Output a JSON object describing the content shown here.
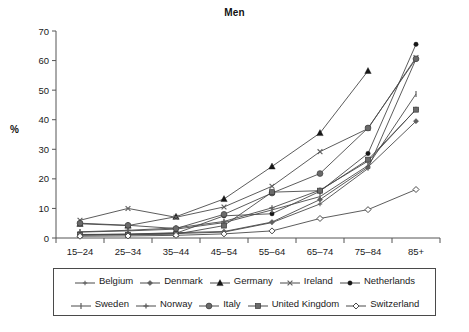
{
  "chart_data": {
    "type": "line",
    "title": "Men",
    "xlabel": "",
    "ylabel": "%",
    "categories": [
      "15–24",
      "25–34",
      "35–44",
      "45–54",
      "55–64",
      "65–74",
      "75–84",
      "85+"
    ],
    "ylim": [
      0,
      70
    ],
    "yticks": [
      0,
      10,
      20,
      30,
      40,
      50,
      60,
      70
    ],
    "grid": false,
    "legend_position": "bottom",
    "series": [
      {
        "name": "Belgium",
        "marker": "plus-small",
        "values": [
          1.0,
          1.2,
          1.5,
          2.0,
          5.2,
          11.5,
          23.5,
          60.5
        ]
      },
      {
        "name": "Denmark",
        "marker": "diamond-small",
        "values": [
          1.2,
          1.3,
          1.8,
          2.2,
          5.4,
          13.0,
          24.0,
          39.5
        ]
      },
      {
        "name": "Germany",
        "marker": "triangle-filled",
        "values": [
          4.8,
          4.2,
          7.2,
          13.2,
          24.2,
          35.5,
          56.5,
          null
        ]
      },
      {
        "name": "Ireland",
        "marker": "x-cross",
        "values": [
          6.0,
          10.0,
          7.0,
          10.5,
          17.5,
          29.2,
          37.0,
          61.0
        ]
      },
      {
        "name": "Netherlands",
        "marker": "circle-filled",
        "values": [
          1.1,
          1.3,
          1.6,
          7.5,
          8.2,
          15.8,
          28.6,
          65.5
        ]
      },
      {
        "name": "Sweden",
        "marker": "bar-vertical",
        "values": [
          2.0,
          2.4,
          3.0,
          5.2,
          9.5,
          14.0,
          24.5,
          48.7
        ]
      },
      {
        "name": "Norway",
        "marker": "plus-medium",
        "values": [
          2.1,
          2.6,
          3.4,
          5.6,
          10.2,
          16.2,
          26.0,
          43.5
        ]
      },
      {
        "name": "Italy",
        "marker": "circle-filled-lg",
        "values": [
          5.0,
          4.3,
          3.2,
          8.0,
          15.2,
          21.8,
          37.2,
          60.6
        ]
      },
      {
        "name": "United Kingdom",
        "marker": "square-filled",
        "values": [
          1.0,
          1.1,
          1.3,
          4.2,
          15.5,
          16.0,
          26.5,
          43.4
        ]
      },
      {
        "name": "Switzerland",
        "marker": "diamond-open",
        "values": [
          0.6,
          0.7,
          0.9,
          1.4,
          2.4,
          6.6,
          9.6,
          16.4
        ]
      }
    ]
  },
  "legend": {
    "row1": [
      {
        "label": "Belgium"
      },
      {
        "label": "Denmark"
      },
      {
        "label": "Germany"
      },
      {
        "label": "Ireland"
      },
      {
        "label": "Netherlands"
      }
    ],
    "row2": [
      {
        "label": "Sweden"
      },
      {
        "label": "Norway"
      },
      {
        "label": "Italy"
      },
      {
        "label": "United Kingdom"
      },
      {
        "label": "Switzerland"
      }
    ]
  }
}
